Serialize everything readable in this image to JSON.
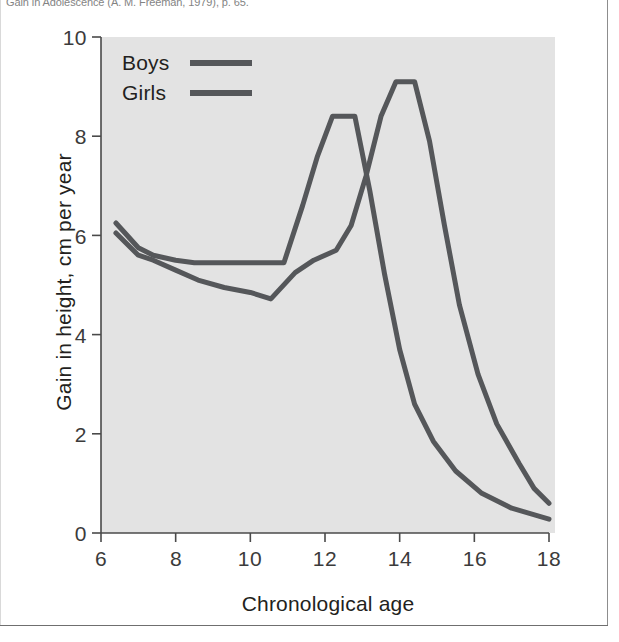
{
  "figure": {
    "caption_text": "Gain in Adolescence (A. M. Freeman, 1979), p. 65.",
    "background_color": "#e3e3e3",
    "frame_color": "#8d8d8d"
  },
  "chart_data": {
    "type": "line",
    "title": "",
    "xlabel": "Chronological age",
    "ylabel": "Gain in height, cm per year",
    "xlim": [
      6,
      18
    ],
    "ylim": [
      0,
      10
    ],
    "xticks": [
      "6",
      "8",
      "10",
      "12",
      "14",
      "16",
      "18"
    ],
    "yticks": [
      "0",
      "2",
      "4",
      "6",
      "8",
      "10"
    ],
    "grid": false,
    "legend_position": "top-left",
    "series": [
      {
        "name": "Boys",
        "color": "#55575a",
        "points": [
          [
            6.4,
            6.25
          ],
          [
            7.0,
            5.75
          ],
          [
            7.4,
            5.6
          ],
          [
            8.0,
            5.5
          ],
          [
            8.5,
            5.45
          ],
          [
            9.0,
            5.45
          ],
          [
            10.9,
            5.45
          ],
          [
            11.4,
            6.6
          ],
          [
            11.8,
            7.6
          ],
          [
            12.2,
            8.4
          ],
          [
            12.8,
            8.4
          ],
          [
            13.2,
            6.9
          ],
          [
            13.6,
            5.2
          ],
          [
            14.0,
            3.7
          ],
          [
            14.4,
            2.6
          ],
          [
            14.9,
            1.85
          ],
          [
            15.5,
            1.25
          ],
          [
            16.2,
            0.8
          ],
          [
            17.0,
            0.5
          ],
          [
            18.0,
            0.28
          ]
        ]
      },
      {
        "name": "Girls",
        "color": "#55575a",
        "points": [
          [
            6.4,
            6.05
          ],
          [
            7.0,
            5.6
          ],
          [
            7.4,
            5.5
          ],
          [
            8.0,
            5.3
          ],
          [
            8.6,
            5.1
          ],
          [
            9.3,
            4.95
          ],
          [
            10.0,
            4.85
          ],
          [
            10.55,
            4.72
          ],
          [
            11.2,
            5.25
          ],
          [
            11.7,
            5.5
          ],
          [
            12.3,
            5.7
          ],
          [
            12.7,
            6.2
          ],
          [
            13.1,
            7.2
          ],
          [
            13.5,
            8.4
          ],
          [
            13.9,
            9.1
          ],
          [
            14.4,
            9.1
          ],
          [
            14.8,
            7.9
          ],
          [
            15.2,
            6.2
          ],
          [
            15.6,
            4.6
          ],
          [
            16.1,
            3.2
          ],
          [
            16.6,
            2.2
          ],
          [
            17.2,
            1.4
          ],
          [
            17.6,
            0.9
          ],
          [
            18.0,
            0.6
          ]
        ]
      }
    ],
    "annotations": [
      {
        "label": "girls-peak",
        "x": 12.2,
        "y": 8.4
      },
      {
        "label": "boys-peak",
        "x": 14.0,
        "y": 9.1
      },
      {
        "label": "mid-childhood-dip",
        "x": 10.55,
        "y": 4.72
      }
    ]
  },
  "legend": {
    "items": [
      {
        "label": "Boys",
        "color": "#55575a"
      },
      {
        "label": "Girls",
        "color": "#55575a"
      }
    ]
  }
}
